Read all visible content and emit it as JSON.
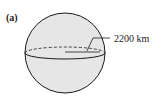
{
  "figure": {
    "panel_label": "(a)",
    "dimension_label": "2200 km",
    "dimension_meaning": "radius",
    "colors": {
      "sphere_fill": "#e6e6e6",
      "outline": "#1a1a1a"
    }
  }
}
